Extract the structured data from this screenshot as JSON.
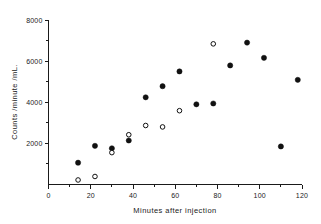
{
  "chart_data": {
    "type": "scatter",
    "title": "",
    "xlabel": "Minutes  after  injection",
    "ylabel": "Counts /minute /mL.",
    "xlim": [
      0,
      120
    ],
    "ylim": [
      0,
      8000
    ],
    "grid": false,
    "legend": "none",
    "x_ticks_major": [
      0,
      20,
      40,
      60,
      80,
      100,
      120
    ],
    "x_tick_labels": [
      "0",
      "20",
      "40",
      "60",
      "80",
      "100",
      "120"
    ],
    "x_ticks_minor": [
      10,
      30,
      50,
      70,
      90,
      110
    ],
    "y_ticks_major": [
      2000,
      4000,
      6000,
      8000
    ],
    "y_tick_labels": [
      "2000",
      "4000",
      "6000",
      "8000"
    ],
    "y_ticks_minor": [
      1000,
      3000,
      5000,
      7000
    ],
    "series": [
      {
        "name": "filled-circles",
        "marker": "filled-circle",
        "color": "#111111",
        "points": [
          {
            "x": 14,
            "y": 1060
          },
          {
            "x": 22,
            "y": 1880
          },
          {
            "x": 30,
            "y": 1760
          },
          {
            "x": 38,
            "y": 2140
          },
          {
            "x": 46,
            "y": 4240
          },
          {
            "x": 54,
            "y": 4780
          },
          {
            "x": 62,
            "y": 5500
          },
          {
            "x": 70,
            "y": 3900
          },
          {
            "x": 78,
            "y": 3940
          },
          {
            "x": 86,
            "y": 5790
          },
          {
            "x": 94,
            "y": 6900
          },
          {
            "x": 102,
            "y": 6160
          },
          {
            "x": 110,
            "y": 1850
          },
          {
            "x": 118,
            "y": 5090
          }
        ]
      },
      {
        "name": "open-circles",
        "marker": "open-circle",
        "color": "#111111",
        "points": [
          {
            "x": 14,
            "y": 220
          },
          {
            "x": 22,
            "y": 390
          },
          {
            "x": 30,
            "y": 1550
          },
          {
            "x": 38,
            "y": 2420
          },
          {
            "x": 46,
            "y": 2870
          },
          {
            "x": 54,
            "y": 2800
          },
          {
            "x": 62,
            "y": 3590
          },
          {
            "x": 78,
            "y": 6840
          }
        ]
      }
    ]
  },
  "axes": {
    "x_title": "Minutes  after  injection",
    "y_title": "Counts /minute /mL."
  }
}
